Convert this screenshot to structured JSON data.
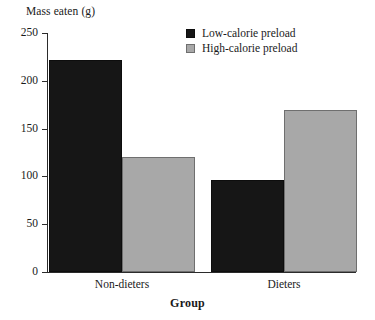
{
  "chart_data": {
    "type": "bar",
    "title": "",
    "xlabel": "Group",
    "ylabel": "Mass eaten (g)",
    "categories": [
      "Non-dieters",
      "Dieters"
    ],
    "series": [
      {
        "name": "Low-calorie preload",
        "color": "#161616",
        "values": [
          222,
          96
        ]
      },
      {
        "name": "High-calorie preload",
        "color": "#a8a8a8",
        "values": [
          120,
          169
        ]
      }
    ],
    "ylim": [
      0,
      250
    ],
    "yticks": [
      0,
      50,
      100,
      150,
      200,
      250
    ],
    "ytick_labels": [
      "0",
      "50",
      "100",
      "150",
      "200",
      "250"
    ],
    "grid": false,
    "legend_position": "top-right"
  },
  "axes": {
    "y_title": "Mass eaten (g)",
    "x_title": "Group"
  },
  "legend": {
    "entries": [
      {
        "label": "Low-calorie preload",
        "swatch": "dark"
      },
      {
        "label": "High-calorie preload",
        "swatch": "light"
      }
    ]
  }
}
